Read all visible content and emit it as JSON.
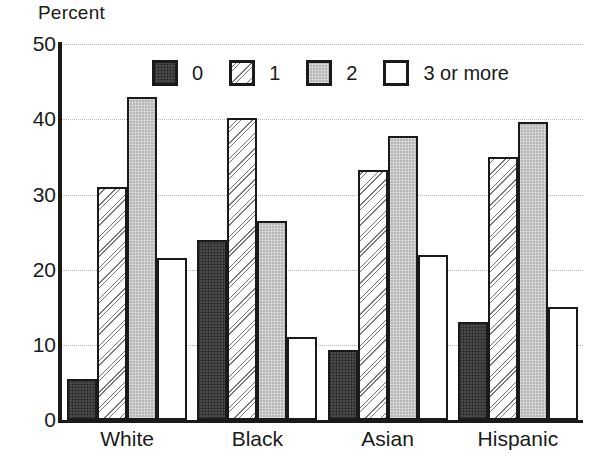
{
  "chart_data": {
    "type": "bar",
    "title": "",
    "ylabel": "Percent",
    "xlabel": "",
    "ylim": [
      0,
      50
    ],
    "yticks": [
      0,
      10,
      20,
      30,
      40,
      50
    ],
    "grid": true,
    "legend_position": "top-center",
    "categories": [
      "White",
      "Black",
      "Asian",
      "Hispanic"
    ],
    "series": [
      {
        "name": "0",
        "values": [
          5.5,
          24.0,
          9.3,
          13.0
        ]
      },
      {
        "name": "1",
        "values": [
          31.0,
          40.2,
          33.2,
          35.0
        ]
      },
      {
        "name": "2",
        "values": [
          43.0,
          26.5,
          37.8,
          39.6
        ]
      },
      {
        "name": "3 or more",
        "values": [
          21.5,
          11.0,
          22.0,
          15.0
        ]
      }
    ]
  },
  "axis": {
    "y_title": "Percent",
    "y_tick_labels": [
      "50",
      "40",
      "30",
      "20",
      "10",
      "0"
    ],
    "x_tick_labels": [
      "White",
      "Black",
      "Asian",
      "Hispanic"
    ]
  },
  "legend": {
    "items": [
      {
        "label": "0",
        "swatch": "dark-crosshatch-swatch"
      },
      {
        "label": "1",
        "swatch": "diagonal-hatch-swatch"
      },
      {
        "label": "2",
        "swatch": "gray-fill-swatch"
      },
      {
        "label": "3 or more",
        "swatch": "white-fill-swatch"
      }
    ]
  },
  "colors": {
    "series_0": "#4a4a4a",
    "series_1": "#ffffff",
    "series_2": "#b6b6b6",
    "series_3": "#ffffff",
    "outline": "#1a1a1a",
    "gridline": "#b4b4b4"
  }
}
